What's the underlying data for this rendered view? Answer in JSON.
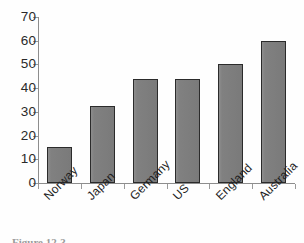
{
  "figure": {
    "caption": "Figure 12-3",
    "background_color": "#ffffff"
  },
  "chart_data": {
    "type": "bar",
    "title": "",
    "subtitle": "",
    "xlabel": "",
    "ylabel": "",
    "categories": [
      "Norway",
      "Japan",
      "Germany",
      "US",
      "England",
      "Australia"
    ],
    "values": [
      15,
      32.5,
      44,
      44,
      50,
      60
    ],
    "ylim": [
      0,
      70
    ],
    "ytick_labels": [
      "0",
      "10",
      "20",
      "30",
      "40",
      "50",
      "60",
      "70"
    ],
    "ytick_values": [
      0,
      10,
      20,
      30,
      40,
      50,
      60,
      70
    ],
    "grid": false,
    "legend": null,
    "legend_position": "none",
    "bar_fill_color": "#7e7e7e",
    "bar_edge_color": "#2b2b2b",
    "axis_color": "#8d8d8d",
    "xtick_label_rotation": -45
  }
}
